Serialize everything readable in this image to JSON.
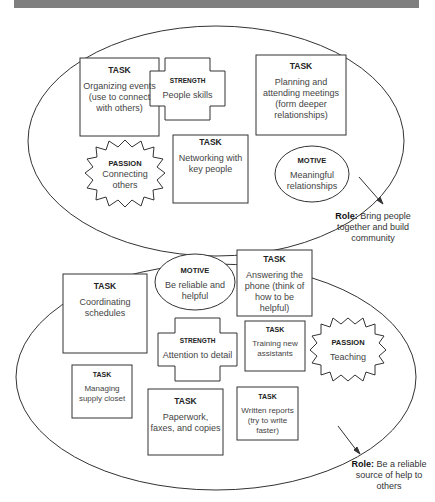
{
  "diagram": {
    "clusters": [
      {
        "role_label": "Role:",
        "role_text": "Bring people together and build community",
        "items": [
          {
            "type": "TASK",
            "text": "Organizing events (use to connect with others)"
          },
          {
            "type": "STRENGTH",
            "text": "People skills"
          },
          {
            "type": "TASK",
            "text": "Planning and attending meetings (form deeper relationships)"
          },
          {
            "type": "PASSION",
            "text": "Connecting others"
          },
          {
            "type": "TASK",
            "text": "Networking with key people"
          },
          {
            "type": "MOTIVE",
            "text": "Meaningful relationships"
          }
        ]
      },
      {
        "role_label": "Role:",
        "role_text": "Be a reliable source of help to others",
        "items": [
          {
            "type": "TASK",
            "text": "Coordinating schedules"
          },
          {
            "type": "MOTIVE",
            "text": "Be reliable and helpful"
          },
          {
            "type": "TASK",
            "text": "Answering the phone (think of how to be helpful)"
          },
          {
            "type": "STRENGTH",
            "text": "Attention to detail"
          },
          {
            "type": "TASK",
            "text": "Training new assistants"
          },
          {
            "type": "PASSION",
            "text": "Teaching"
          },
          {
            "type": "TASK",
            "text": "Managing supply closet"
          },
          {
            "type": "TASK",
            "text": "Paperwork, faxes, and copies"
          },
          {
            "type": "TASK",
            "text": "Written reports (try to write faster)"
          }
        ]
      }
    ]
  }
}
